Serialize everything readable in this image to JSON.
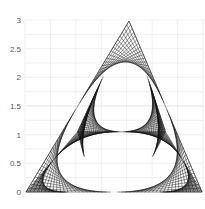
{
  "chart_data": {
    "type": "scatter",
    "title": "",
    "xlabel": "",
    "ylabel": "",
    "ylim": [
      0,
      3
    ],
    "xlim": [
      0,
      3.4
    ],
    "y_ticks": [
      "0",
      "0.5",
      "1",
      "1.5",
      "2",
      "2.5",
      "3"
    ],
    "x_ticks": [],
    "grid": true,
    "legend": "none",
    "triangle": {
      "apex": [
        1.7,
        2.93
      ],
      "bottom_left": [
        0.0,
        0.0
      ],
      "bottom_right": [
        3.4,
        0.0
      ]
    },
    "inner_crossbar_y": 1.05,
    "line_color": "#111111"
  },
  "render": {
    "plot": {
      "x0": 25,
      "x1": 203,
      "y0": 192,
      "y3": 20
    },
    "apex_px": [
      129,
      21
    ],
    "bl_px": [
      26,
      192
    ],
    "br_px": [
      202,
      192
    ],
    "steps": 22
  }
}
